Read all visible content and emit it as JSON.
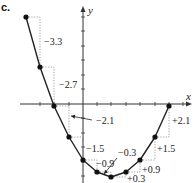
{
  "part_label": "c.",
  "axes": {
    "x_label": "x",
    "y_label": "y",
    "origin_px": [
      83,
      104
    ],
    "x_range_px": [
      20,
      192
    ],
    "y_range_px": [
      6,
      183
    ],
    "x_tick_px": [
      40,
      54,
      69,
      97,
      111,
      126,
      140,
      155,
      169,
      183
    ],
    "y_tick_px": [
      17,
      31,
      46,
      60,
      75,
      89,
      118,
      133,
      147,
      162,
      176
    ]
  },
  "curve": {
    "color": "#222222",
    "points_px": [
      [
        26,
        17
      ],
      [
        40,
        67
      ],
      [
        54,
        106
      ],
      [
        69,
        137
      ],
      [
        83,
        160
      ],
      [
        97,
        172
      ],
      [
        111,
        177
      ],
      [
        126,
        172
      ],
      [
        140,
        160
      ],
      [
        155,
        137
      ],
      [
        169,
        106
      ]
    ]
  },
  "differences": [
    {
      "text": "−3.3",
      "label_px": [
        44,
        45
      ]
    },
    {
      "text": "−2.7",
      "label_px": [
        59,
        88
      ]
    },
    {
      "text": "−2.1",
      "label_px": [
        96,
        124
      ],
      "arrow": [
        [
          92,
          120
        ],
        [
          71,
          116
        ]
      ]
    },
    {
      "text": "−1.5",
      "label_px": [
        86,
        152
      ]
    },
    {
      "text": "−0.9",
      "label_px": [
        96,
        167
      ]
    },
    {
      "text": "−0.3",
      "label_px": [
        118,
        156
      ],
      "arrow": [
        [
          117,
          158
        ],
        [
          104,
          174
        ]
      ]
    },
    {
      "text": "+0.3",
      "label_px": [
        127,
        182
      ]
    },
    {
      "text": "+0.9",
      "label_px": [
        142,
        173
      ]
    },
    {
      "text": "+1.5",
      "label_px": [
        157,
        152
      ]
    },
    {
      "text": "+2.1",
      "label_px": [
        172,
        124
      ]
    }
  ]
}
